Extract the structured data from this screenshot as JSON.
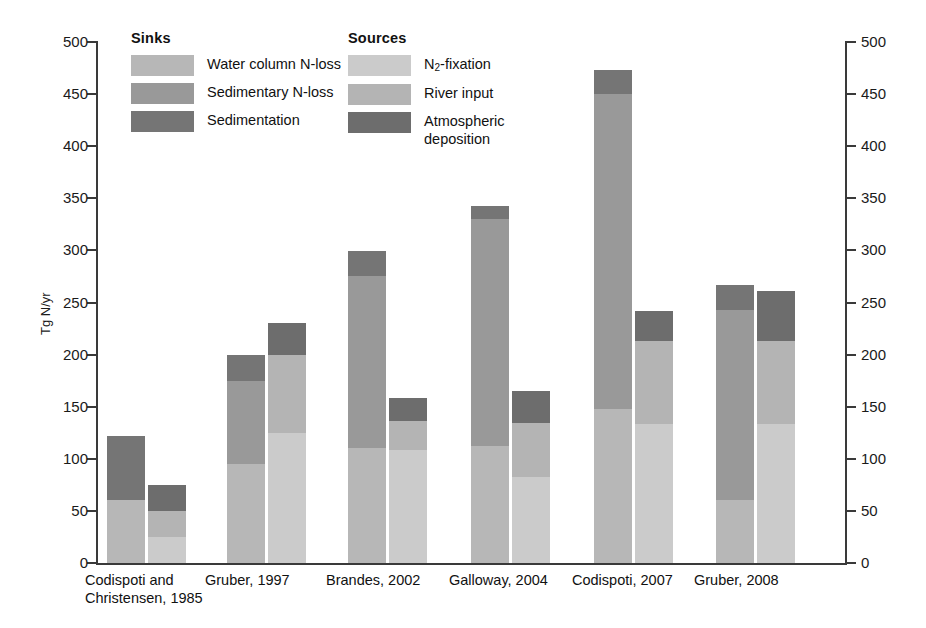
{
  "chart_data": {
    "type": "bar",
    "subtype": "stacked-grouped",
    "title": "",
    "xlabel": "",
    "ylabel": "Tg N/yr",
    "ylim": [
      0,
      500
    ],
    "ytick_step": 50,
    "yticks": [
      "0",
      "50",
      "100",
      "150",
      "200",
      "250",
      "300",
      "350",
      "400",
      "450",
      "500"
    ],
    "grid": false,
    "dual_axis": true,
    "categories": [
      "Codispoti and\nChristensen, 1985",
      "Gruber, 1997",
      "Brandes, 2002",
      "Galloway, 2004",
      "Codispoti, 2007",
      "Gruber, 2008"
    ],
    "groups": [
      {
        "name": "Sinks",
        "series": [
          {
            "name": "Water column N-loss",
            "color": "#b7b7b7",
            "values": [
              60,
              95,
              110,
              112,
              148,
              60
            ]
          },
          {
            "name": "Sedimentary N-loss",
            "color": "#999999",
            "values": [
              0,
              80,
              165,
              218,
              302,
              183
            ]
          },
          {
            "name": "Sedimentation",
            "color": "#757575",
            "values": [
              62,
              25,
              24,
              13,
              23,
              24
            ]
          }
        ],
        "totals": [
          122,
          200,
          299,
          343,
          473,
          267
        ]
      },
      {
        "name": "Sources",
        "series": [
          {
            "name": "N₂-fixation",
            "color": "#cbcbcb",
            "values": [
              25,
              125,
              108,
              83,
              133,
              133
            ]
          },
          {
            "name": "River input",
            "color": "#b4b4b4",
            "values": [
              25,
              75,
              28,
              51,
              80,
              80
            ]
          },
          {
            "name": "Atmospheric\ndeposition",
            "color": "#6d6d6d",
            "values": [
              25,
              30,
              22,
              31,
              29,
              48
            ]
          }
        ],
        "totals": [
          75,
          230,
          158,
          165,
          242,
          261
        ]
      }
    ]
  },
  "legend": {
    "sinks": {
      "title": "Sinks",
      "items": [
        {
          "label": "Water column N-loss",
          "color": "#b7b7b7",
          "swatch_name": "legend-swatch-water-column-n-loss"
        },
        {
          "label": "Sedimentary N-loss",
          "color": "#999999",
          "swatch_name": "legend-swatch-sedimentary-n-loss"
        },
        {
          "label": "Sedimentation",
          "color": "#757575",
          "swatch_name": "legend-swatch-sedimentation"
        }
      ]
    },
    "sources": {
      "title": "Sources",
      "items": [
        {
          "label": "N2-fixation",
          "label_html_prefix": "N",
          "label_sub": "2",
          "label_suffix": "-fixation",
          "color": "#cbcbcb",
          "swatch_name": "legend-swatch-n2-fixation"
        },
        {
          "label": "River input",
          "color": "#b4b4b4",
          "swatch_name": "legend-swatch-river-input"
        },
        {
          "label": "Atmospheric\ndeposition",
          "color": "#6d6d6d",
          "swatch_name": "legend-swatch-atmospheric-deposition"
        }
      ]
    }
  },
  "axis": {
    "y_title": "Tg N/yr",
    "left_ticks": [
      "500",
      "450",
      "400",
      "350",
      "300",
      "250",
      "200",
      "150",
      "100",
      "50",
      "0"
    ],
    "right_ticks": [
      "500",
      "450",
      "400",
      "350",
      "300",
      "250",
      "200",
      "150",
      "100",
      "50",
      "0"
    ]
  },
  "colors": {
    "axis": "#3a3a3a",
    "text": "#1a1a1a",
    "background": "#ffffff"
  }
}
